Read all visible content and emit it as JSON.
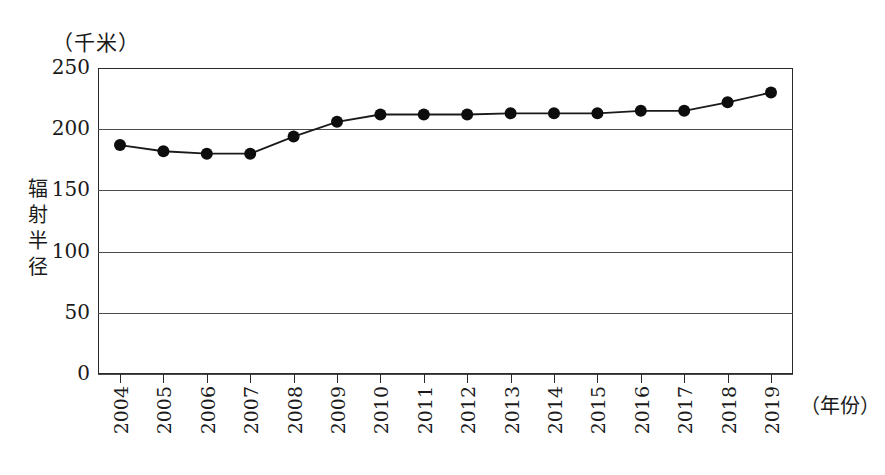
{
  "chart_data": {
    "type": "line",
    "title": "",
    "unit_label": "（千米）",
    "ylabel": "辐射半径",
    "xlabel": "（年份）",
    "categories": [
      "2004",
      "2005",
      "2006",
      "2007",
      "2008",
      "2009",
      "2010",
      "2011",
      "2012",
      "2013",
      "2014",
      "2015",
      "2016",
      "2017",
      "2018",
      "2019"
    ],
    "values": [
      187,
      182,
      180,
      180,
      194,
      206,
      212,
      212,
      212,
      213,
      213,
      213,
      215,
      215,
      222,
      230
    ],
    "ylim": [
      0,
      250
    ],
    "yticks": [
      "0",
      "50",
      "100",
      "150",
      "200",
      "250"
    ],
    "ytick_values": [
      0,
      50,
      100,
      150,
      200,
      250
    ],
    "grid": "horizontal",
    "legend": "none",
    "marker": "filled-circle",
    "line_color": "#1a1a1a",
    "marker_color": "#0d0d0d",
    "grid_color": "#4a4a4a",
    "frame_color": "#2a2a2a",
    "background": "#ffffff"
  }
}
